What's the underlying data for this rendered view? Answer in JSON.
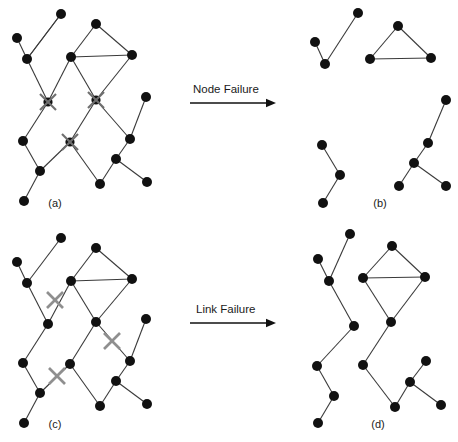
{
  "figure": {
    "width": 458,
    "height": 442,
    "background": "#ffffff",
    "edge_color": "#3a3a3a",
    "node_color": "#111111",
    "xmark_color": "#8f8f8f",
    "text_color": "#1a1a1a"
  },
  "arrows": [
    {
      "id": "node-failure",
      "label": "Node Failure",
      "label_x": 193,
      "label_y": 93,
      "x1": 190,
      "y1": 103,
      "x2": 276,
      "y2": 103
    },
    {
      "id": "link-failure",
      "label": "Link Failure",
      "label_x": 196,
      "label_y": 313,
      "x1": 190,
      "y1": 323,
      "x2": 276,
      "y2": 323
    }
  ],
  "panels": [
    {
      "id": "a",
      "label": "(a)",
      "label_x": 55,
      "label_y": 207,
      "caption_note": "original network with failed nodes marked",
      "nodes": [
        {
          "id": "a1",
          "x": 17,
          "y": 38,
          "r": 5.0
        },
        {
          "id": "a2",
          "x": 27,
          "y": 59,
          "r": 5.0
        },
        {
          "id": "a3",
          "x": 61,
          "y": 14,
          "r": 5.0
        },
        {
          "id": "a4",
          "x": 71,
          "y": 57,
          "r": 5.0
        },
        {
          "id": "a5",
          "x": 96,
          "y": 24,
          "r": 5.0
        },
        {
          "id": "a6",
          "x": 132,
          "y": 55,
          "r": 5.0
        },
        {
          "id": "a7",
          "x": 23,
          "y": 141,
          "r": 5.0
        },
        {
          "id": "a8",
          "x": 40,
          "y": 171,
          "r": 5.0
        },
        {
          "id": "a9",
          "x": 24,
          "y": 201,
          "r": 5.0
        },
        {
          "id": "a10",
          "x": 100,
          "y": 184,
          "r": 5.0
        },
        {
          "id": "a11",
          "x": 146,
          "y": 97,
          "r": 5.0
        },
        {
          "id": "a12",
          "x": 130,
          "y": 139,
          "r": 5.0
        },
        {
          "id": "a13",
          "x": 116,
          "y": 159,
          "r": 5.0
        },
        {
          "id": "a14",
          "x": 147,
          "y": 182,
          "r": 5.0
        }
      ],
      "failed_nodes": [
        {
          "id": "ax1",
          "x": 48,
          "y": 102,
          "size": 8
        },
        {
          "id": "ax2",
          "x": 96,
          "y": 100,
          "size": 8
        },
        {
          "id": "ax3",
          "x": 70,
          "y": 142,
          "size": 8
        }
      ],
      "edges": [
        {
          "from": "a1",
          "to": "a2"
        },
        {
          "from": "a2",
          "to": "a3"
        },
        {
          "from": "a2",
          "to": "ax1"
        },
        {
          "from": "a3",
          "to": "a2"
        },
        {
          "from": "ax1",
          "to": "a4"
        },
        {
          "from": "ax1",
          "to": "a7"
        },
        {
          "from": "a4",
          "to": "a5"
        },
        {
          "from": "a4",
          "to": "a6"
        },
        {
          "from": "a5",
          "to": "a6"
        },
        {
          "from": "a4",
          "to": "ax2"
        },
        {
          "from": "a6",
          "to": "ax2"
        },
        {
          "from": "ax2",
          "to": "ax3"
        },
        {
          "from": "ax2",
          "to": "a12"
        },
        {
          "from": "a7",
          "to": "a8"
        },
        {
          "from": "a8",
          "to": "a9"
        },
        {
          "from": "a8",
          "to": "ax3"
        },
        {
          "from": "ax3",
          "to": "a10"
        },
        {
          "from": "a11",
          "to": "a12"
        },
        {
          "from": "a12",
          "to": "a13"
        },
        {
          "from": "a13",
          "to": "a10"
        },
        {
          "from": "a13",
          "to": "a14"
        }
      ]
    },
    {
      "id": "b",
      "label": "(b)",
      "label_x": 380,
      "label_y": 207,
      "caption_note": "fragmented network after node failure",
      "nodes": [
        {
          "id": "b1",
          "x": 315,
          "y": 42,
          "r": 5.0
        },
        {
          "id": "b2",
          "x": 325,
          "y": 64,
          "r": 5.0
        },
        {
          "id": "b3",
          "x": 358,
          "y": 13,
          "r": 5.0
        },
        {
          "id": "b4",
          "x": 370,
          "y": 59,
          "r": 5.0
        },
        {
          "id": "b5",
          "x": 398,
          "y": 26,
          "r": 5.0
        },
        {
          "id": "b6",
          "x": 431,
          "y": 58,
          "r": 5.0
        },
        {
          "id": "b7",
          "x": 322,
          "y": 145,
          "r": 5.0
        },
        {
          "id": "b8",
          "x": 340,
          "y": 175,
          "r": 5.0
        },
        {
          "id": "b9",
          "x": 323,
          "y": 203,
          "r": 5.0
        },
        {
          "id": "b10",
          "x": 446,
          "y": 100,
          "r": 5.0
        },
        {
          "id": "b11",
          "x": 428,
          "y": 143,
          "r": 5.0
        },
        {
          "id": "b12",
          "x": 414,
          "y": 163,
          "r": 5.0
        },
        {
          "id": "b13",
          "x": 399,
          "y": 186,
          "r": 5.0
        },
        {
          "id": "b14",
          "x": 446,
          "y": 186,
          "r": 5.0
        }
      ],
      "failed_nodes": [],
      "edges": [
        {
          "from": "b1",
          "to": "b2"
        },
        {
          "from": "b2",
          "to": "b3"
        },
        {
          "from": "b4",
          "to": "b5"
        },
        {
          "from": "b4",
          "to": "b6"
        },
        {
          "from": "b5",
          "to": "b6"
        },
        {
          "from": "b7",
          "to": "b8"
        },
        {
          "from": "b8",
          "to": "b9"
        },
        {
          "from": "b10",
          "to": "b11"
        },
        {
          "from": "b11",
          "to": "b12"
        },
        {
          "from": "b12",
          "to": "b13"
        },
        {
          "from": "b12",
          "to": "b14"
        }
      ]
    },
    {
      "id": "c",
      "label": "(c)",
      "label_x": 55,
      "label_y": 428,
      "caption_note": "original network with failed links marked",
      "nodes": [
        {
          "id": "c1",
          "x": 17,
          "y": 262,
          "r": 5.0
        },
        {
          "id": "c2",
          "x": 27,
          "y": 283,
          "r": 5.0
        },
        {
          "id": "c3",
          "x": 61,
          "y": 238,
          "r": 5.0
        },
        {
          "id": "c4",
          "x": 71,
          "y": 281,
          "r": 5.0
        },
        {
          "id": "c5",
          "x": 96,
          "y": 248,
          "r": 5.0
        },
        {
          "id": "c6",
          "x": 132,
          "y": 279,
          "r": 5.0
        },
        {
          "id": "c7",
          "x": 48,
          "y": 324,
          "r": 5.0
        },
        {
          "id": "c8",
          "x": 96,
          "y": 322,
          "r": 5.0
        },
        {
          "id": "c9",
          "x": 23,
          "y": 363,
          "r": 5.0
        },
        {
          "id": "c10",
          "x": 70,
          "y": 364,
          "r": 5.0
        },
        {
          "id": "c11",
          "x": 40,
          "y": 393,
          "r": 5.0
        },
        {
          "id": "c12",
          "x": 24,
          "y": 423,
          "r": 5.0
        },
        {
          "id": "c13",
          "x": 100,
          "y": 406,
          "r": 5.0
        },
        {
          "id": "c14",
          "x": 146,
          "y": 319,
          "r": 5.0
        },
        {
          "id": "c15",
          "x": 130,
          "y": 361,
          "r": 5.0
        },
        {
          "id": "c16",
          "x": 116,
          "y": 381,
          "r": 5.0
        },
        {
          "id": "c17",
          "x": 147,
          "y": 404,
          "r": 5.0
        }
      ],
      "failed_links": [
        {
          "id": "cx1",
          "x": 55,
          "y": 300,
          "size": 8
        },
        {
          "id": "cx2",
          "x": 112,
          "y": 341,
          "size": 8
        },
        {
          "id": "cx3",
          "x": 57,
          "y": 376,
          "size": 8
        }
      ],
      "edges": [
        {
          "from": "c1",
          "to": "c2"
        },
        {
          "from": "c2",
          "to": "c3"
        },
        {
          "from": "c2",
          "to": "c7"
        },
        {
          "from": "c4",
          "to": "c7"
        },
        {
          "from": "c4",
          "to": "c5"
        },
        {
          "from": "c4",
          "to": "c6"
        },
        {
          "from": "c5",
          "to": "c6"
        },
        {
          "from": "c4",
          "to": "c8"
        },
        {
          "from": "c6",
          "to": "c8"
        },
        {
          "from": "c8",
          "to": "c10"
        },
        {
          "from": "c8",
          "to": "c15"
        },
        {
          "from": "c7",
          "to": "c9"
        },
        {
          "from": "c9",
          "to": "c11"
        },
        {
          "from": "c11",
          "to": "c10"
        },
        {
          "from": "c11",
          "to": "c12"
        },
        {
          "from": "c10",
          "to": "c13"
        },
        {
          "from": "c14",
          "to": "c15"
        },
        {
          "from": "c15",
          "to": "c16"
        },
        {
          "from": "c16",
          "to": "c13"
        },
        {
          "from": "c16",
          "to": "c17"
        }
      ]
    },
    {
      "id": "d",
      "label": "(d)",
      "label_x": 378,
      "label_y": 428,
      "caption_note": "fragmented network after link failure",
      "nodes": [
        {
          "id": "d1",
          "x": 350,
          "y": 234,
          "r": 5.0
        },
        {
          "id": "d2",
          "x": 318,
          "y": 259,
          "r": 5.0
        },
        {
          "id": "d3",
          "x": 329,
          "y": 281,
          "r": 5.0
        },
        {
          "id": "d4",
          "x": 354,
          "y": 326,
          "r": 5.0
        },
        {
          "id": "d5",
          "x": 317,
          "y": 366,
          "r": 5.0
        },
        {
          "id": "d6",
          "x": 334,
          "y": 396,
          "r": 5.0
        },
        {
          "id": "d7",
          "x": 318,
          "y": 423,
          "r": 5.0
        },
        {
          "id": "d8",
          "x": 363,
          "y": 278,
          "r": 5.0
        },
        {
          "id": "d9",
          "x": 392,
          "y": 246,
          "r": 5.0
        },
        {
          "id": "d10",
          "x": 425,
          "y": 277,
          "r": 5.0
        },
        {
          "id": "d11",
          "x": 391,
          "y": 322,
          "r": 5.0
        },
        {
          "id": "d12",
          "x": 363,
          "y": 365,
          "r": 5.0
        },
        {
          "id": "d13",
          "x": 395,
          "y": 407,
          "r": 5.0
        },
        {
          "id": "d14",
          "x": 410,
          "y": 382,
          "r": 5.0
        },
        {
          "id": "d15",
          "x": 426,
          "y": 361,
          "r": 5.0
        },
        {
          "id": "d16",
          "x": 441,
          "y": 405,
          "r": 5.0
        }
      ],
      "failed_links": [],
      "edges": [
        {
          "from": "d1",
          "to": "d3"
        },
        {
          "from": "d2",
          "to": "d3"
        },
        {
          "from": "d3",
          "to": "d4"
        },
        {
          "from": "d4",
          "to": "d5"
        },
        {
          "from": "d5",
          "to": "d6"
        },
        {
          "from": "d6",
          "to": "d7"
        },
        {
          "from": "d8",
          "to": "d9"
        },
        {
          "from": "d8",
          "to": "d10"
        },
        {
          "from": "d9",
          "to": "d10"
        },
        {
          "from": "d8",
          "to": "d11"
        },
        {
          "from": "d10",
          "to": "d11"
        },
        {
          "from": "d11",
          "to": "d12"
        },
        {
          "from": "d12",
          "to": "d13"
        },
        {
          "from": "d13",
          "to": "d14"
        },
        {
          "from": "d14",
          "to": "d15"
        },
        {
          "from": "d14",
          "to": "d16"
        }
      ]
    }
  ]
}
